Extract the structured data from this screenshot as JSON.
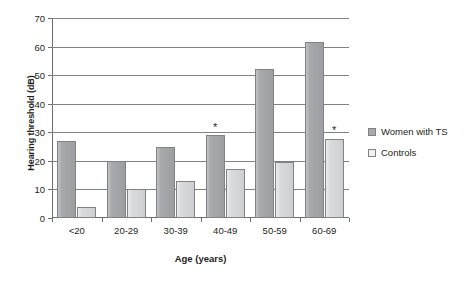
{
  "chart_data": {
    "type": "bar",
    "title": "",
    "xlabel": "Age (years)",
    "ylabel": "Hearing threshold (dB)",
    "categories": [
      "<20",
      "20-29",
      "30-39",
      "40-49",
      "50-59",
      "60-69"
    ],
    "series": [
      {
        "name": "Women with TS",
        "color": "#a7a9ac",
        "values": [
          27,
          20,
          24.7,
          29,
          52,
          61.5
        ]
      },
      {
        "name": "Controls",
        "color": "#d9dadb",
        "values": [
          4,
          10,
          12.8,
          17,
          19.7,
          27.5
        ]
      }
    ],
    "ylim": [
      0,
      70
    ],
    "yticks": [
      0,
      10,
      20,
      30,
      40,
      50,
      60,
      70
    ],
    "ytick_labels": [
      "0",
      "10",
      "20",
      "30",
      "40",
      "50",
      "60",
      "70"
    ],
    "grid": true,
    "legend_position": "right",
    "annotations": [
      {
        "text": "*",
        "category": "40-49",
        "series": "Women with TS",
        "value": 33
      },
      {
        "text": "*",
        "category": "60-69",
        "series": "Controls",
        "value": 32
      }
    ]
  },
  "caption": ""
}
